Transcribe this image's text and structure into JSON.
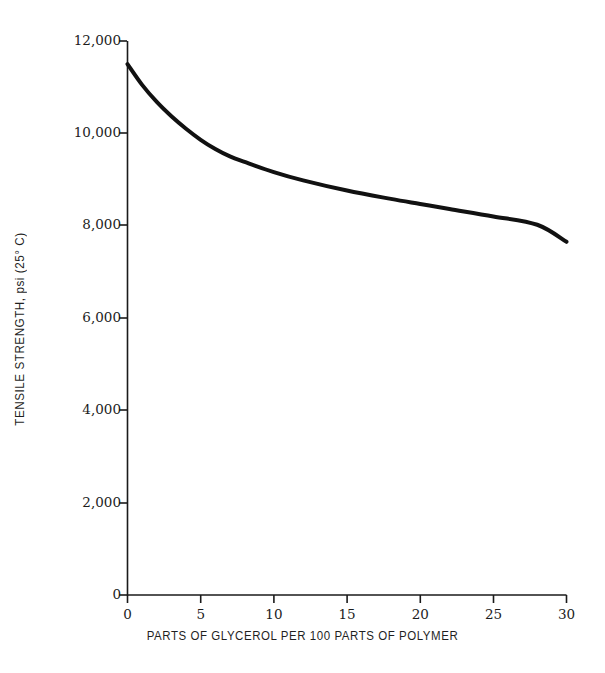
{
  "chart_data": {
    "type": "line",
    "title": "",
    "subtitle": "",
    "xlabel": "PARTS OF GLYCEROL PER 100 PARTS OF POLYMER",
    "ylabel": "TENSILE STRENGTH, psi (25° C)",
    "xlim": [
      0,
      30
    ],
    "ylim": [
      0,
      12000
    ],
    "grid": false,
    "legend": false,
    "legend_position": "none",
    "line_color": "#111111",
    "line_width_px": 4,
    "background_color": "#ffffff",
    "axis_color": "#1a1a1a",
    "xticks": [
      0,
      5,
      10,
      15,
      20,
      25,
      30
    ],
    "xtick_labels": [
      "0",
      "5",
      "10",
      "15",
      "20",
      "25",
      "30"
    ],
    "yticks": [
      0,
      2000,
      4000,
      6000,
      8000,
      10000,
      12000
    ],
    "ytick_labels": [
      "0",
      "2,000",
      "4,000",
      "6,000",
      "8,000",
      "10,000",
      "12,000"
    ],
    "series": [
      {
        "name": "Tensile strength vs glycerol content",
        "x": [
          0,
          1,
          2,
          3,
          4,
          5,
          6,
          7,
          8,
          10,
          12,
          15,
          18,
          20,
          22,
          25,
          28,
          30
        ],
        "values": [
          11500,
          11050,
          10680,
          10370,
          10100,
          9860,
          9660,
          9500,
          9380,
          9160,
          8980,
          8760,
          8580,
          8470,
          8360,
          8200,
          8020,
          7650
        ]
      }
    ],
    "annotations": []
  },
  "axis_titles": {
    "x": "PARTS OF GLYCEROL PER 100 PARTS OF POLYMER",
    "y": "TENSILE STRENGTH, psi (25° C)"
  },
  "ytick_labels": {
    "t0": "0",
    "t1": "2,000",
    "t2": "4,000",
    "t3": "6,000",
    "t4": "8,000",
    "t5": "10,000",
    "t6": "12,000"
  },
  "xtick_labels": {
    "t0": "0",
    "t1": "5",
    "t2": "10",
    "t3": "15",
    "t4": "20",
    "t5": "25",
    "t6": "30"
  }
}
